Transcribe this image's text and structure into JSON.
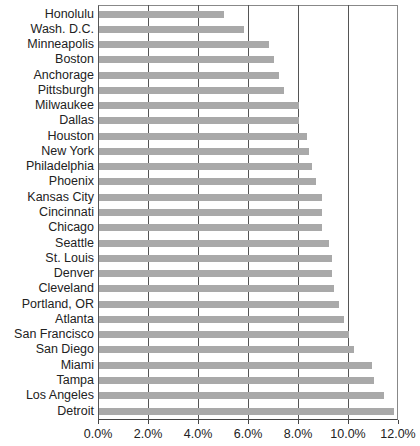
{
  "chart_data": {
    "type": "bar",
    "orientation": "horizontal",
    "title": "",
    "xlabel": "",
    "ylabel": "",
    "categories": [
      "Honolulu",
      "Wash. D.C.",
      "Minneapolis",
      "Boston",
      "Anchorage",
      "Pittsburgh",
      "Milwaukee",
      "Dallas",
      "Houston",
      "New York",
      "Philadelphia",
      "Phoenix",
      "Kansas City",
      "Cincinnati",
      "Chicago",
      "Seattle",
      "St. Louis",
      "Denver",
      "Cleveland",
      "Portland, OR",
      "Atlanta",
      "San Francisco",
      "San Diego",
      "Miami",
      "Tampa",
      "Los Angeles",
      "Detroit"
    ],
    "values": [
      5.0,
      5.8,
      6.8,
      7.0,
      7.2,
      7.4,
      8.0,
      8.0,
      8.3,
      8.4,
      8.5,
      8.7,
      8.9,
      8.9,
      8.9,
      9.2,
      9.3,
      9.3,
      9.4,
      9.6,
      9.8,
      10.0,
      10.2,
      10.9,
      11.0,
      11.4,
      11.8
    ],
    "unit": "%",
    "xlim": [
      0,
      12
    ],
    "x_ticks": [
      "0.0%",
      "2.0%",
      "4.0%",
      "6.0%",
      "8.0%",
      "10.0%",
      "12.0%"
    ],
    "x_tick_values": [
      0,
      2,
      4,
      6,
      8,
      10,
      12
    ],
    "grid": "vertical",
    "legend": "none",
    "bar_color": "#a9a9a9"
  }
}
